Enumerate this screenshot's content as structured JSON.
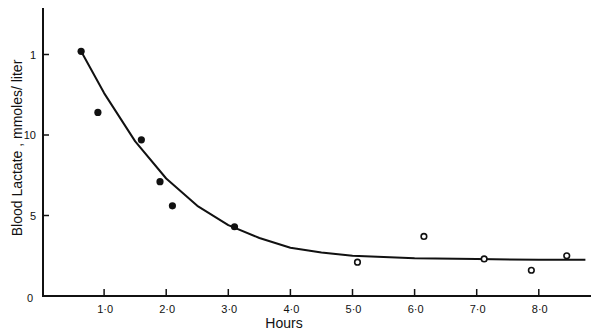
{
  "chart_data": {
    "type": "scatter",
    "title": "",
    "xlabel": "Hours",
    "ylabel": "Blood Lactate, mmoles/ liter",
    "xlim": [
      0,
      8.9
    ],
    "ylim": [
      0,
      17
    ],
    "x_ticks": [
      1.0,
      2.0,
      3.0,
      4.0,
      5.0,
      6.0,
      7.0,
      8.0
    ],
    "x_tick_labels": [
      "1·0",
      "2·0",
      "3·0",
      "4·0",
      "5·0",
      "6·0",
      "7·0",
      "8·0"
    ],
    "y_ticks": [
      0,
      5,
      10,
      15
    ],
    "y_tick_labels": [
      "0",
      "5",
      "10",
      "1"
    ],
    "grid": false,
    "legend": null,
    "series": [
      {
        "name": "filled",
        "marker": "filled-circle",
        "x": [
          0.63,
          0.9,
          1.6,
          1.9,
          2.1,
          3.1
        ],
        "y": [
          15.2,
          11.4,
          9.7,
          7.1,
          5.6,
          4.3
        ]
      },
      {
        "name": "open",
        "marker": "open-circle",
        "x": [
          5.08,
          6.15,
          7.12,
          7.88,
          8.45
        ],
        "y": [
          2.1,
          3.7,
          2.3,
          1.6,
          2.5
        ]
      },
      {
        "name": "fitted-curve",
        "marker": "line",
        "x": [
          0.63,
          1.0,
          1.5,
          2.0,
          2.5,
          3.0,
          3.5,
          4.0,
          4.5,
          5.0,
          6.0,
          7.0,
          8.0,
          8.75
        ],
        "y": [
          15.2,
          12.6,
          9.6,
          7.3,
          5.6,
          4.4,
          3.6,
          3.0,
          2.7,
          2.5,
          2.35,
          2.3,
          2.25,
          2.25
        ]
      }
    ]
  },
  "axes": {
    "x_title": "Hours",
    "y_title": "Blood  Lactate , mmoles/ liter"
  }
}
